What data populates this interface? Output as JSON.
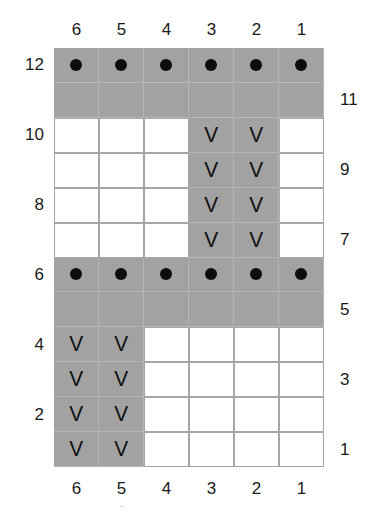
{
  "chart_data": {
    "type": "table",
    "title": "",
    "columns": [
      "6",
      "5",
      "4",
      "3",
      "2",
      "1"
    ],
    "rows_top_to_bottom": [
      12,
      11,
      10,
      9,
      8,
      7,
      6,
      5,
      4,
      3,
      2,
      1
    ],
    "cells": [
      [
        {
          "fill": "grey",
          "symbol": "dot"
        },
        {
          "fill": "grey",
          "symbol": "dot"
        },
        {
          "fill": "grey",
          "symbol": "dot"
        },
        {
          "fill": "grey",
          "symbol": "dot"
        },
        {
          "fill": "grey",
          "symbol": "dot"
        },
        {
          "fill": "grey",
          "symbol": "dot"
        }
      ],
      [
        {
          "fill": "grey",
          "symbol": ""
        },
        {
          "fill": "grey",
          "symbol": ""
        },
        {
          "fill": "grey",
          "symbol": ""
        },
        {
          "fill": "grey",
          "symbol": ""
        },
        {
          "fill": "grey",
          "symbol": ""
        },
        {
          "fill": "grey",
          "symbol": ""
        }
      ],
      [
        {
          "fill": "white",
          "symbol": ""
        },
        {
          "fill": "white",
          "symbol": ""
        },
        {
          "fill": "white",
          "symbol": ""
        },
        {
          "fill": "grey",
          "symbol": "V"
        },
        {
          "fill": "grey",
          "symbol": "V"
        },
        {
          "fill": "white",
          "symbol": ""
        }
      ],
      [
        {
          "fill": "white",
          "symbol": ""
        },
        {
          "fill": "white",
          "symbol": ""
        },
        {
          "fill": "white",
          "symbol": ""
        },
        {
          "fill": "grey",
          "symbol": "V"
        },
        {
          "fill": "grey",
          "symbol": "V"
        },
        {
          "fill": "white",
          "symbol": ""
        }
      ],
      [
        {
          "fill": "white",
          "symbol": ""
        },
        {
          "fill": "white",
          "symbol": ""
        },
        {
          "fill": "white",
          "symbol": ""
        },
        {
          "fill": "grey",
          "symbol": "V"
        },
        {
          "fill": "grey",
          "symbol": "V"
        },
        {
          "fill": "white",
          "symbol": ""
        }
      ],
      [
        {
          "fill": "white",
          "symbol": ""
        },
        {
          "fill": "white",
          "symbol": ""
        },
        {
          "fill": "white",
          "symbol": ""
        },
        {
          "fill": "grey",
          "symbol": "V"
        },
        {
          "fill": "grey",
          "symbol": "V"
        },
        {
          "fill": "white",
          "symbol": ""
        }
      ],
      [
        {
          "fill": "grey",
          "symbol": "dot"
        },
        {
          "fill": "grey",
          "symbol": "dot"
        },
        {
          "fill": "grey",
          "symbol": "dot"
        },
        {
          "fill": "grey",
          "symbol": "dot"
        },
        {
          "fill": "grey",
          "symbol": "dot"
        },
        {
          "fill": "grey",
          "symbol": "dot"
        }
      ],
      [
        {
          "fill": "grey",
          "symbol": ""
        },
        {
          "fill": "grey",
          "symbol": ""
        },
        {
          "fill": "grey",
          "symbol": ""
        },
        {
          "fill": "grey",
          "symbol": ""
        },
        {
          "fill": "grey",
          "symbol": ""
        },
        {
          "fill": "grey",
          "symbol": ""
        }
      ],
      [
        {
          "fill": "grey",
          "symbol": "V"
        },
        {
          "fill": "grey",
          "symbol": "V"
        },
        {
          "fill": "white",
          "symbol": ""
        },
        {
          "fill": "white",
          "symbol": ""
        },
        {
          "fill": "white",
          "symbol": ""
        },
        {
          "fill": "white",
          "symbol": ""
        }
      ],
      [
        {
          "fill": "grey",
          "symbol": "V"
        },
        {
          "fill": "grey",
          "symbol": "V"
        },
        {
          "fill": "white",
          "symbol": ""
        },
        {
          "fill": "white",
          "symbol": ""
        },
        {
          "fill": "white",
          "symbol": ""
        },
        {
          "fill": "white",
          "symbol": ""
        }
      ],
      [
        {
          "fill": "grey",
          "symbol": "V"
        },
        {
          "fill": "grey",
          "symbol": "V"
        },
        {
          "fill": "white",
          "symbol": ""
        },
        {
          "fill": "white",
          "symbol": ""
        },
        {
          "fill": "white",
          "symbol": ""
        },
        {
          "fill": "white",
          "symbol": ""
        }
      ],
      [
        {
          "fill": "grey",
          "symbol": "V"
        },
        {
          "fill": "grey",
          "symbol": "V"
        },
        {
          "fill": "white",
          "symbol": ""
        },
        {
          "fill": "white",
          "symbol": ""
        },
        {
          "fill": "white",
          "symbol": ""
        },
        {
          "fill": "white",
          "symbol": ""
        }
      ]
    ],
    "left_row_labels": [
      "12",
      "10",
      "8",
      "6",
      "4",
      "2"
    ],
    "right_row_labels": [
      "11",
      "9",
      "7",
      "5",
      "3",
      "1"
    ],
    "colors": {
      "grey_cell": "#a2a2a2",
      "white_cell": "#ffffff",
      "grid_line": "#a8a8a8",
      "symbol": "#111111"
    },
    "legend": []
  },
  "labels": {
    "top_columns": [
      "6",
      "5",
      "4",
      "3",
      "2",
      "1"
    ],
    "bottom_columns": [
      "6",
      "5",
      "4",
      "3",
      "2",
      "1"
    ],
    "left_rows": [
      {
        "text": "12",
        "row": 12
      },
      {
        "text": "10",
        "row": 10
      },
      {
        "text": "8",
        "row": 8
      },
      {
        "text": "6",
        "row": 6
      },
      {
        "text": "4",
        "row": 4
      },
      {
        "text": "2",
        "row": 2
      }
    ],
    "right_rows": [
      {
        "text": "11",
        "row": 11
      },
      {
        "text": "9",
        "row": 9
      },
      {
        "text": "7",
        "row": 7
      },
      {
        "text": "5",
        "row": 5
      },
      {
        "text": "3",
        "row": 3
      },
      {
        "text": "1",
        "row": 1
      }
    ]
  },
  "symbols": {
    "dot": "dot-icon",
    "V": "V"
  }
}
